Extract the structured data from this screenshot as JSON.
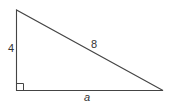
{
  "diagram": {
    "type": "right-triangle",
    "vertices": {
      "top": [
        16.5,
        10
      ],
      "right_angle": [
        16.5,
        90.5
      ],
      "right": [
        163,
        90.5
      ]
    },
    "right_angle_marker_size": 7,
    "colors": {
      "stroke": "#444444",
      "text": "#333333",
      "background": "#ffffff"
    },
    "labels": {
      "vertical_leg": "4",
      "hypotenuse": "8",
      "horizontal_leg": "a"
    }
  }
}
